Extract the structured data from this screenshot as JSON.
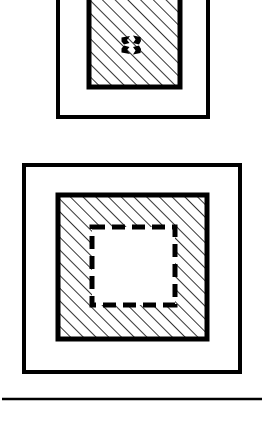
{
  "page": {
    "title": "Technical line drawing — nested square cross-sections",
    "background_color": "#ffffff",
    "ink_color": "#000000",
    "width": 264,
    "height": 427
  },
  "figures": [
    {
      "id": "upper-figure",
      "name": "upper-nested-square-figure",
      "description": "Upper cross-section: outer square frame containing a smaller diagonally hatched square with a four-arrow convergence symbol at its center. Clipped by the top edge of the image.",
      "clipped_at_top": true,
      "outer_square": {
        "name": "upper-outer-square",
        "x": 58,
        "y": -14,
        "width": 150,
        "height": 131,
        "stroke_width": 4,
        "fill": "none"
      },
      "hatched_square": {
        "name": "upper-hatched-square",
        "x": 89,
        "y": -14,
        "width": 91,
        "height": 101,
        "stroke_width": 5,
        "fill": "diagonal-hatch",
        "hatch_angle_degrees": 45,
        "hatch_spacing_px": 9,
        "hatch_stroke_width": 1.6
      },
      "center_symbol": {
        "name": "four-arrow-convergence-icon",
        "label": "converging arrows",
        "center_x": 131,
        "center_y": 45,
        "arrow_count": 4,
        "size": 26
      }
    },
    {
      "id": "lower-figure",
      "name": "lower-nested-square-figure",
      "description": "Lower cross-section: outer square frame containing a diagonally hatched square which in turn contains a dashed-outline square void.",
      "clipped_at_top": false,
      "outer_square": {
        "name": "lower-outer-square",
        "x": 24,
        "y": 165,
        "width": 216,
        "height": 207,
        "stroke_width": 4,
        "fill": "none"
      },
      "hatched_square": {
        "name": "lower-hatched-square",
        "x": 58,
        "y": 195,
        "width": 149,
        "height": 144,
        "stroke_width": 5,
        "fill": "diagonal-hatch",
        "hatch_angle_degrees": 45,
        "hatch_spacing_px": 9,
        "hatch_stroke_width": 1.6
      },
      "dashed_square": {
        "name": "lower-dashed-inner-square",
        "x": 92,
        "y": 227,
        "width": 83,
        "height": 78,
        "stroke_width": 5,
        "dash_pattern": "13 7",
        "fill": "#ffffff"
      }
    }
  ],
  "rule": {
    "name": "bottom-horizontal-rule",
    "x1": 2,
    "y1": 399,
    "x2": 262,
    "y2": 399,
    "stroke_width": 2.5
  }
}
